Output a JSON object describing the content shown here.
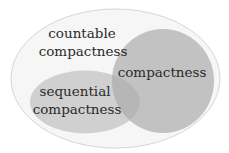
{
  "diagram": {
    "type": "venn",
    "background": "#ffffff",
    "sets": [
      {
        "id": "countable-compactness",
        "label_lines": [
          "countable",
          "compactness"
        ],
        "fill": "#f6f6f6",
        "stroke": "#d6d6d6",
        "contains": [
          "compactness",
          "sequential-compactness"
        ]
      },
      {
        "id": "compactness",
        "label_lines": [
          "compactness"
        ],
        "fill": "#c2c2c2"
      },
      {
        "id": "sequential-compactness",
        "label_lines": [
          "sequential",
          "compactness"
        ],
        "fill": "#d0d0d0"
      }
    ],
    "overlap_fill": "#b6b6b6",
    "text_color": "#2a2a2a"
  },
  "labels": {
    "countable_line1": "countable",
    "countable_line2": "compactness",
    "compactness": "compactness",
    "sequential_line1": "sequential",
    "sequential_line2": "compactness"
  }
}
